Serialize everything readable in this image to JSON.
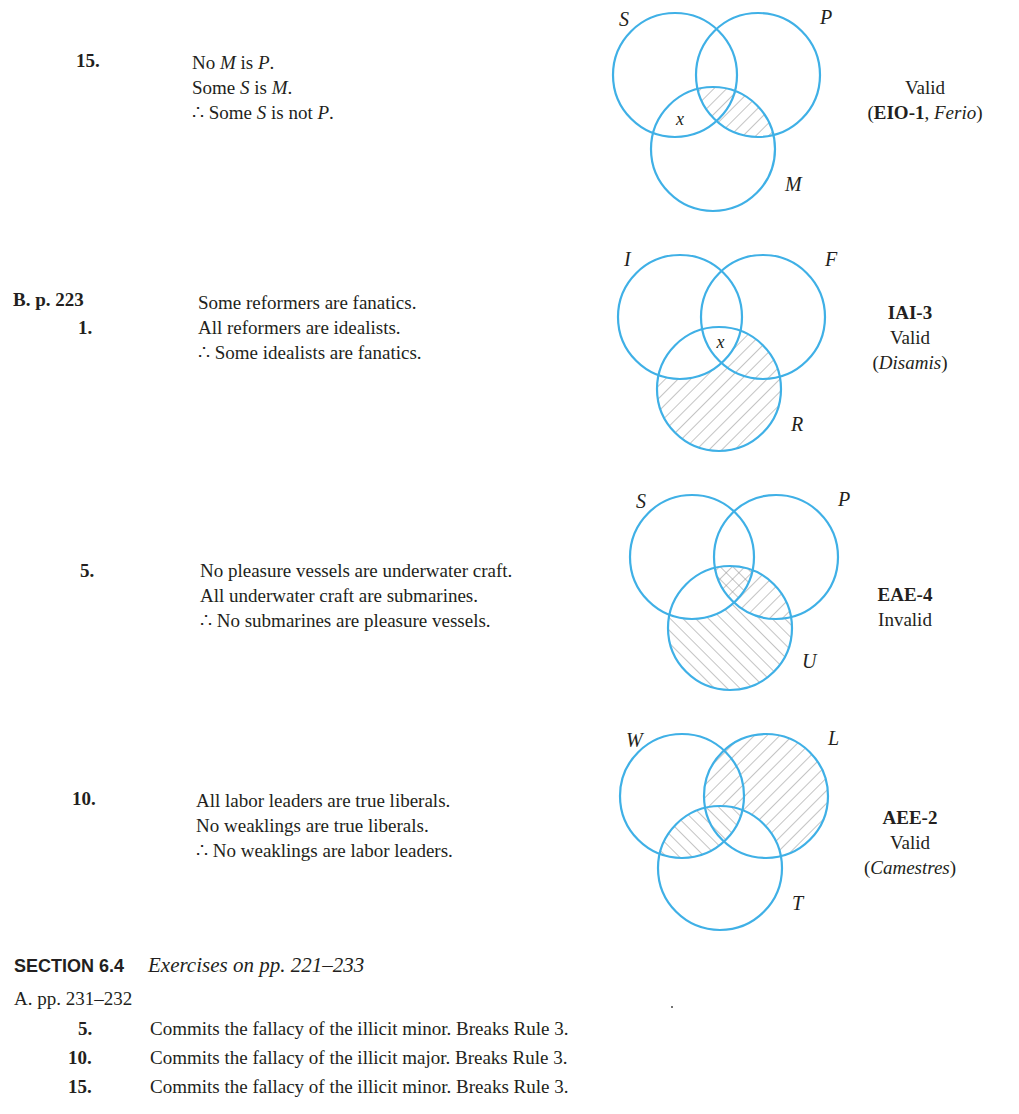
{
  "problems": [
    {
      "number": "15.",
      "premises": [
        [
          {
            "t": "No "
          },
          {
            "t": "M",
            "i": true
          },
          {
            "t": " is "
          },
          {
            "t": "P",
            "i": true
          },
          {
            "t": "."
          }
        ],
        [
          {
            "t": "Some "
          },
          {
            "t": "S",
            "i": true
          },
          {
            "t": " is "
          },
          {
            "t": "M",
            "i": true
          },
          {
            "t": "."
          }
        ],
        [
          {
            "t": "∴ Some "
          },
          {
            "t": "S",
            "i": true
          },
          {
            "t": " is not "
          },
          {
            "t": "P",
            "i": true
          },
          {
            "t": "."
          }
        ]
      ],
      "venn": {
        "labels": {
          "a": "S",
          "b": "P",
          "c": "M"
        },
        "shading": [
          {
            "region": "b∩c not a",
            "style": "forward"
          },
          {
            "region": "a∩b∩c",
            "style": "forward"
          }
        ],
        "x_mark": {
          "region": "a∩c not b",
          "text": "x"
        }
      },
      "verdict_lines": [
        [
          {
            "t": "Valid"
          }
        ],
        [
          {
            "t": "("
          },
          {
            "t": "EIO-1",
            "b": true
          },
          {
            "t": ", "
          },
          {
            "t": "Ferio",
            "i": true
          },
          {
            "t": ")"
          }
        ]
      ]
    },
    {
      "section_label": "B. p. 223",
      "number": "1.",
      "premises": [
        [
          {
            "t": "Some reformers are fanatics."
          }
        ],
        [
          {
            "t": "All reformers are idealists."
          }
        ],
        [
          {
            "t": "∴ Some idealists are fanatics."
          }
        ]
      ],
      "venn": {
        "labels": {
          "a": "I",
          "b": "F",
          "c": "R"
        },
        "shading": [
          {
            "region": "c not a",
            "style": "forward"
          }
        ],
        "x_mark": {
          "region": "a∩b∩c",
          "text": "x"
        }
      },
      "verdict_lines": [
        [
          {
            "t": "IAI-3",
            "b": true
          }
        ],
        [
          {
            "t": "Valid"
          }
        ],
        [
          {
            "t": "("
          },
          {
            "t": "Disamis",
            "i": true
          },
          {
            "t": ")"
          }
        ]
      ]
    },
    {
      "number": "5.",
      "premises": [
        [
          {
            "t": "No pleasure vessels are underwater craft."
          }
        ],
        [
          {
            "t": "All underwater craft are submarines."
          }
        ],
        [
          {
            "t": "∴ No submarines are pleasure vessels."
          }
        ]
      ],
      "venn": {
        "labels": {
          "a": "S",
          "b": "P",
          "c": "U"
        },
        "shading": [
          {
            "region": "b∩c",
            "style": "forward"
          },
          {
            "region": "c not a, not b",
            "style": "backward"
          },
          {
            "region": "a∩b∩c",
            "style": "cross"
          }
        ]
      },
      "verdict_lines": [
        [
          {
            "t": "EAE-4",
            "b": true
          }
        ],
        [
          {
            "t": "Invalid"
          }
        ]
      ]
    },
    {
      "number": "10.",
      "premises": [
        [
          {
            "t": "All labor leaders are true liberals."
          }
        ],
        [
          {
            "t": "No weaklings are true liberals."
          }
        ],
        [
          {
            "t": "∴ No weaklings are labor leaders."
          }
        ]
      ],
      "venn": {
        "labels": {
          "a": "W",
          "b": "L",
          "c": "T"
        },
        "shading": [
          {
            "region": "b not c",
            "style": "forward"
          },
          {
            "region": "a∩c",
            "style": "backward"
          }
        ]
      },
      "verdict_lines": [
        [
          {
            "t": "AEE-2",
            "b": true
          }
        ],
        [
          {
            "t": "Valid"
          }
        ],
        [
          {
            "t": "("
          },
          {
            "t": "Camestres",
            "i": true
          },
          {
            "t": ")"
          }
        ]
      ]
    }
  ],
  "section": {
    "heading": "SECTION 6.4",
    "title": "Exercises on pp. 221–233",
    "part_label": "A. pp. 231–232",
    "answers": [
      {
        "number": "5.",
        "text": "Commits the fallacy of the illicit minor. Breaks Rule 3."
      },
      {
        "number": "10.",
        "text": "Commits the fallacy of the illicit major. Breaks Rule 3."
      },
      {
        "number": "15.",
        "text": "Commits the fallacy of the illicit minor. Breaks Rule 3."
      }
    ]
  },
  "colors": {
    "circle": "#3fb0e6",
    "hatch": "#8a8a8a",
    "text": "#231f20"
  }
}
